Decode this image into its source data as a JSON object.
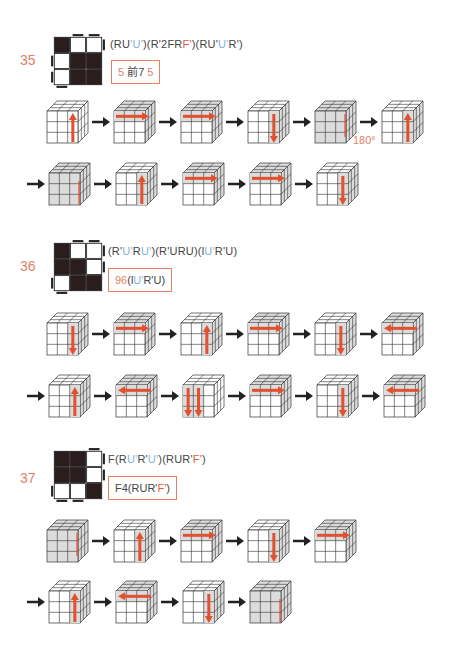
{
  "cases": [
    {
      "number": "35",
      "pattern": [
        [
          1,
          0,
          0
        ],
        [
          0,
          1,
          1
        ],
        [
          0,
          1,
          1
        ]
      ],
      "formula_parts": [
        {
          "t": "(RU",
          "c": ""
        },
        {
          "t": "'",
          "c": "blue"
        },
        {
          "t": "U",
          "c": "blue"
        },
        {
          "t": "'",
          "c": "blue"
        },
        {
          "t": ")(R'2FR",
          "c": ""
        },
        {
          "t": "F'",
          "c": "red"
        },
        {
          "t": ")(RU'",
          "c": ""
        },
        {
          "t": "U",
          "c": "blue"
        },
        {
          "t": "'",
          "c": "blue"
        },
        {
          "t": "R')",
          "c": ""
        }
      ],
      "formula_text": "(RU'U')(R'2FRF')(RU'U'R')",
      "hint_parts": [
        {
          "t": "5",
          "c": "pink"
        },
        {
          "t": "  前7  ",
          "c": ""
        },
        {
          "t": "5",
          "c": "pink"
        }
      ],
      "hint_text": "5 前7 5",
      "rows": [
        {
          "lead_arrow": false,
          "cubes": [
            {
              "move": "up-right",
              "shade": "none"
            },
            {
              "move": "right-top",
              "shade": "top-row"
            },
            {
              "move": "right-top",
              "shade": "top-row"
            },
            {
              "move": "down-right",
              "shade": "right-col"
            },
            {
              "move": "down-right-faint",
              "shade": "all",
              "label": "180°"
            },
            {
              "move": "up-right",
              "shade": "right-col"
            }
          ]
        },
        {
          "lead_arrow": true,
          "cubes": [
            {
              "move": "up-right-faint",
              "shade": "all"
            },
            {
              "move": "up-right",
              "shade": "right-col"
            },
            {
              "move": "right-top",
              "shade": "top-row"
            },
            {
              "move": "right-top",
              "shade": "top-row"
            },
            {
              "move": "down-right",
              "shade": "right-col"
            }
          ]
        }
      ]
    },
    {
      "number": "36",
      "pattern": [
        [
          1,
          0,
          0
        ],
        [
          1,
          1,
          0
        ],
        [
          0,
          1,
          1
        ]
      ],
      "formula_parts": [
        {
          "t": "(R'",
          "c": ""
        },
        {
          "t": "U'",
          "c": "blue"
        },
        {
          "t": "R",
          "c": ""
        },
        {
          "t": "U'",
          "c": "blue"
        },
        {
          "t": ")(R'URU)(l",
          "c": ""
        },
        {
          "t": "U'",
          "c": "blue"
        },
        {
          "t": "R'U)",
          "c": ""
        }
      ],
      "formula_text": "(R'U'RU')(R'URU)(lU'R'U)",
      "hint_parts": [
        {
          "t": "96",
          "c": "pink"
        },
        {
          "t": "(l",
          "c": ""
        },
        {
          "t": "U'",
          "c": "blue"
        },
        {
          "t": "R'U)",
          "c": ""
        }
      ],
      "hint_text": "96(lU'R'U)",
      "rows": [
        {
          "lead_arrow": false,
          "cubes": [
            {
              "move": "down-right",
              "shade": "right-col"
            },
            {
              "move": "right-top",
              "shade": "top-row"
            },
            {
              "move": "up-right",
              "shade": "right-col"
            },
            {
              "move": "right-top",
              "shade": "top-row"
            },
            {
              "move": "down-right",
              "shade": "right-col"
            },
            {
              "move": "left-top",
              "shade": "top-row"
            }
          ]
        },
        {
          "lead_arrow": true,
          "cubes": [
            {
              "move": "up-right",
              "shade": "right-col"
            },
            {
              "move": "left-top",
              "shade": "top-row"
            },
            {
              "move": "double-down",
              "shade": "two-cols"
            },
            {
              "move": "right-top",
              "shade": "top-row"
            },
            {
              "move": "down-right",
              "shade": "right-col"
            },
            {
              "move": "left-top",
              "shade": "top-row"
            }
          ]
        }
      ]
    },
    {
      "number": "37",
      "pattern": [
        [
          1,
          1,
          0
        ],
        [
          1,
          1,
          0
        ],
        [
          0,
          0,
          1
        ]
      ],
      "formula_parts": [
        {
          "t": "F(R",
          "c": ""
        },
        {
          "t": "U'",
          "c": "blue"
        },
        {
          "t": "R'",
          "c": ""
        },
        {
          "t": "U'",
          "c": "blue"
        },
        {
          "t": ")(RUR'",
          "c": ""
        },
        {
          "t": "F'",
          "c": "red"
        },
        {
          "t": ")",
          "c": ""
        }
      ],
      "formula_text": "F(RU'R'U')(RUR'F')",
      "hint_parts": [
        {
          "t": "F4(RUR'",
          "c": ""
        },
        {
          "t": "F'",
          "c": "red"
        },
        {
          "t": ")",
          "c": ""
        }
      ],
      "hint_text": "F4(RUR'F')",
      "rows": [
        {
          "lead_arrow": false,
          "cubes": [
            {
              "move": "down-right-faint",
              "shade": "all"
            },
            {
              "move": "up-right",
              "shade": "right-col"
            },
            {
              "move": "right-top",
              "shade": "top-row"
            },
            {
              "move": "down-right",
              "shade": "right-col"
            },
            {
              "move": "right-top",
              "shade": "top-row"
            }
          ]
        },
        {
          "lead_arrow": true,
          "cubes": [
            {
              "move": "up-right",
              "shade": "right-col"
            },
            {
              "move": "left-top",
              "shade": "top-row"
            },
            {
              "move": "down-right",
              "shade": "right-col"
            },
            {
              "move": "up-right-faint",
              "shade": "all"
            }
          ]
        }
      ]
    }
  ],
  "colors": {
    "accent_arrow": "#e2512f",
    "number_color": "#e0826a",
    "blue_move": "#7fb2d8",
    "sticker_dark": "#2b1d1d",
    "shade": "#dcdcdc"
  }
}
